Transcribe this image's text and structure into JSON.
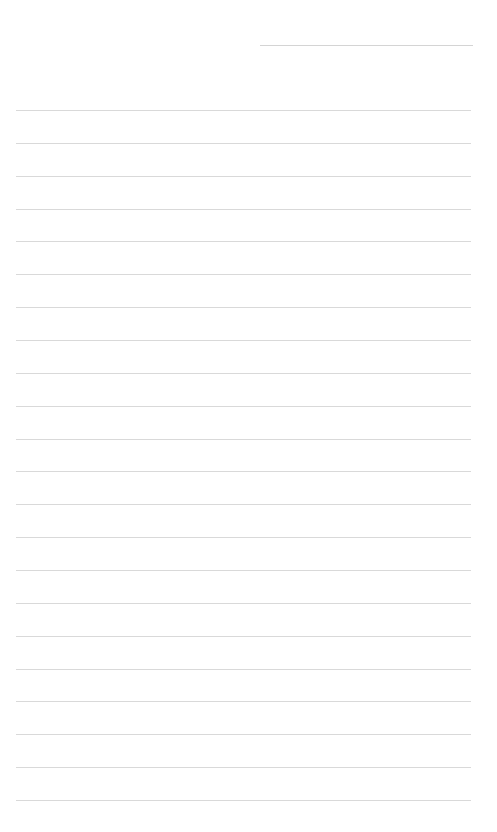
{
  "page": {
    "type": "blank-lined-page",
    "header_line": {
      "x": 260,
      "y": 45,
      "width": 213
    },
    "ruled_lines": {
      "count": 22,
      "start_y": 110,
      "spacing": 32.86,
      "x": 16,
      "width": 455
    },
    "line_color": "#d9d9d9",
    "background": "#ffffff"
  }
}
